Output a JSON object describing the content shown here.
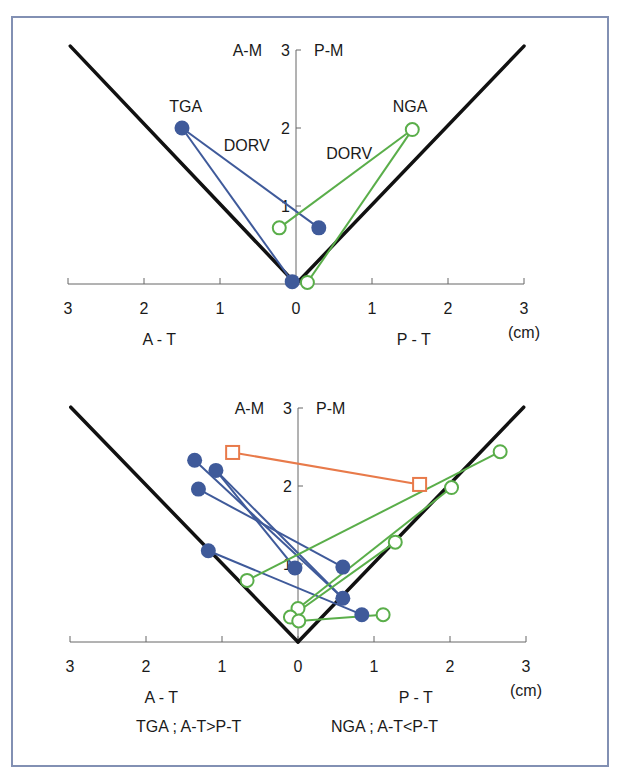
{
  "colors": {
    "frame": "#8290b3",
    "tga": "#3f5a9a",
    "nga": "#5aae4a",
    "special": "#e87a4a",
    "boundary": "#111111",
    "axis": "#666666"
  },
  "caption": {
    "tga": "TGA ; A-T>P-T",
    "nga": "NGA ; A-T<P-T"
  },
  "chart_data": [
    {
      "type": "scatter",
      "title": "",
      "xlabel_left": "A - T",
      "xlabel_right": "P - T",
      "ylabel_left": "A-M",
      "ylabel_right": "P-M",
      "unit": "(cm)",
      "xlim": [
        -3,
        3
      ],
      "ylim": [
        0,
        3
      ],
      "x_ticks": [
        "3",
        "2",
        "1",
        "0",
        "1",
        "2",
        "3"
      ],
      "y_ticks": [
        "1",
        "2",
        "3"
      ],
      "grid": false,
      "annotations": [
        {
          "text": "TGA",
          "x": -1.45,
          "y": 2.2
        },
        {
          "text": "DORV",
          "x": -0.65,
          "y": 1.7
        },
        {
          "text": "NGA",
          "x": 1.5,
          "y": 2.2
        },
        {
          "text": "DORV",
          "x": 0.7,
          "y": 1.6
        }
      ],
      "boundary_lines": [
        {
          "x1": -2.97,
          "y1": 3.05,
          "x2": 0,
          "y2": 0
        },
        {
          "x1": 0,
          "y1": 0,
          "x2": 3.0,
          "y2": 3.05
        }
      ],
      "series": [
        {
          "name": "TGA",
          "marker": "filled-circle",
          "points": [
            [
              -1.5,
              2.0
            ],
            [
              0.3,
              0.72
            ],
            [
              -0.05,
              0.03
            ]
          ],
          "segments": [
            [
              [
                -1.5,
                2.0
              ],
              [
                0.3,
                0.72
              ]
            ],
            [
              [
                -1.5,
                2.0
              ],
              [
                -0.05,
                0.03
              ]
            ]
          ]
        },
        {
          "name": "NGA",
          "marker": "open-circle",
          "points": [
            [
              1.53,
              1.98
            ],
            [
              -0.22,
              0.72
            ],
            [
              0.15,
              0.02
            ]
          ],
          "segments": [
            [
              [
                1.53,
                1.98
              ],
              [
                -0.22,
                0.72
              ]
            ],
            [
              [
                1.53,
                1.98
              ],
              [
                0.15,
                0.02
              ]
            ]
          ]
        }
      ]
    },
    {
      "type": "scatter",
      "title": "",
      "xlabel_left": "A - T",
      "xlabel_right": "P - T",
      "ylabel_left": "A-M",
      "ylabel_right": "P-M",
      "unit": "(cm)",
      "xlim": [
        -3,
        3
      ],
      "ylim": [
        0,
        3
      ],
      "x_ticks": [
        "3",
        "2",
        "1",
        "0",
        "1",
        "2",
        "3"
      ],
      "y_ticks": [
        "1",
        "2",
        "3"
      ],
      "grid": false,
      "annotations": [],
      "boundary_lines": [
        {
          "x1": -2.99,
          "y1": 3.01,
          "x2": 0,
          "y2": 0
        },
        {
          "x1": 0,
          "y1": 0,
          "x2": 2.97,
          "y2": 3.01
        }
      ],
      "series": [
        {
          "name": "TGA",
          "marker": "filled-circle",
          "points": [
            [
              -1.36,
              2.33
            ],
            [
              -1.08,
              2.2
            ],
            [
              -1.31,
              1.96
            ],
            [
              -1.18,
              1.17
            ],
            [
              -0.04,
              0.95
            ],
            [
              0.59,
              0.96
            ],
            [
              0.59,
              0.56
            ],
            [
              0.84,
              0.35
            ]
          ],
          "segments": [
            [
              [
                -1.36,
                2.33
              ],
              [
                0.59,
                0.56
              ]
            ],
            [
              [
                -1.08,
                2.2
              ],
              [
                0.59,
                0.56
              ]
            ],
            [
              [
                -1.08,
                2.2
              ],
              [
                -0.04,
                0.95
              ]
            ],
            [
              [
                -1.31,
                1.96
              ],
              [
                0.59,
                0.96
              ]
            ],
            [
              [
                -1.18,
                1.17
              ],
              [
                0.84,
                0.35
              ]
            ]
          ]
        },
        {
          "name": "NGA",
          "marker": "open-circle",
          "points": [
            [
              2.66,
              2.44
            ],
            [
              2.02,
              1.98
            ],
            [
              1.28,
              1.28
            ],
            [
              1.12,
              0.35
            ],
            [
              0.0,
              0.43
            ],
            [
              -0.1,
              0.32
            ],
            [
              0.01,
              0.27
            ],
            [
              -0.67,
              0.79
            ]
          ],
          "segments": [
            [
              [
                -0.67,
                0.79
              ],
              [
                2.66,
                2.44
              ]
            ],
            [
              [
                0.0,
                0.43
              ],
              [
                2.02,
                1.98
              ]
            ],
            [
              [
                -0.1,
                0.32
              ],
              [
                1.28,
                1.28
              ]
            ],
            [
              [
                0.01,
                0.27
              ],
              [
                1.12,
                0.35
              ]
            ]
          ]
        },
        {
          "name": "special",
          "marker": "open-square",
          "points": [
            [
              -0.86,
              2.43
            ],
            [
              1.6,
              2.02
            ]
          ],
          "segments": [
            [
              [
                -0.86,
                2.43
              ],
              [
                1.6,
                2.02
              ]
            ]
          ]
        }
      ]
    }
  ]
}
